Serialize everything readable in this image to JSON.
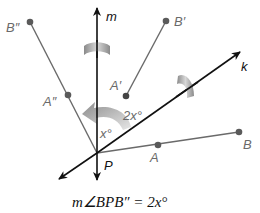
{
  "diagram": {
    "lines": {
      "m": {
        "label": "m",
        "from": [
          97,
          180
        ],
        "to": [
          97,
          6
        ]
      },
      "k": {
        "label": "k",
        "from": [
          59,
          179
        ],
        "to": [
          240,
          52
        ]
      }
    },
    "points": {
      "P": {
        "label": "P",
        "xy": [
          97,
          153
        ]
      },
      "A": {
        "label": "A",
        "xy": [
          158,
          145
        ]
      },
      "B": {
        "label": "B",
        "xy": [
          239,
          132
        ]
      },
      "A_prime": {
        "label": "A′",
        "xy": [
          126,
          96
        ]
      },
      "B_prime": {
        "label": "B′",
        "xy": [
          166,
          21
        ]
      },
      "A_dprime": {
        "label": "A″",
        "xy": [
          68,
          95
        ]
      },
      "B_dprime": {
        "label": "B″",
        "xy": [
          30,
          22
        ]
      }
    },
    "angle_labels": {
      "x": "x°",
      "two_x": "2x°"
    },
    "caption": {
      "m_angle": "m∠",
      "text": "BPB″ = 2x°"
    },
    "colors": {
      "axis": "#111111",
      "segment": "#6a6a6a",
      "point": "#5a5a5a",
      "arrow_gray": "#9a9a9a"
    }
  }
}
